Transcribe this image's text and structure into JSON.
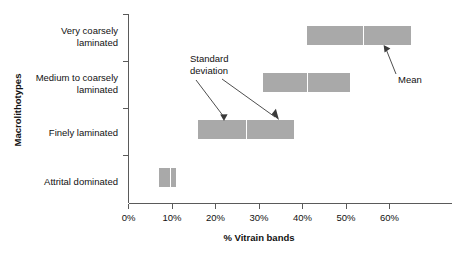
{
  "chart_data": {
    "type": "bar",
    "orientation": "horizontal",
    "title": "",
    "xlabel": "% Vitrain bands",
    "ylabel": "Macrolithotypes",
    "xlim": [
      0,
      67
    ],
    "ylim": [
      0,
      4
    ],
    "grid": false,
    "legend": null,
    "x_ticks": [
      {
        "value": 0,
        "label": "0%"
      },
      {
        "value": 10,
        "label": "10%"
      },
      {
        "value": 20,
        "label": "20%"
      },
      {
        "value": 30,
        "label": "30%"
      },
      {
        "value": 40,
        "label": "40%"
      },
      {
        "value": 50,
        "label": "50%"
      },
      {
        "value": 60,
        "label": "60%"
      }
    ],
    "categories": [
      "Very coarsely laminated",
      "Medium to coarsely laminated",
      "Finely laminated",
      "Attrital dominated"
    ],
    "category_labels_wrapped": [
      [
        "Very coarsely",
        "laminated"
      ],
      [
        "Medium to coarsely",
        "laminated"
      ],
      [
        "Finely laminated"
      ],
      [
        "Attrital dominated"
      ]
    ],
    "series_description": "Mean % vitrain bands with +/- one standard deviation range shown as a shaded bar; white vertical line marks the mean.",
    "bars": [
      {
        "category": "Very coarsely laminated",
        "low": 41,
        "high": 65,
        "mean": 54
      },
      {
        "category": "Medium to coarsely laminated",
        "low": 31,
        "high": 51,
        "mean": 41
      },
      {
        "category": "Finely laminated",
        "low": 16,
        "high": 38,
        "mean": 27
      },
      {
        "category": "Attrital dominated",
        "low": 7,
        "high": 11,
        "mean": 9.5
      }
    ],
    "annotations": [
      {
        "name": "standard-deviation",
        "lines": [
          "Standard",
          "deviation"
        ],
        "points_to": "Finely laminated bar edges"
      },
      {
        "name": "mean",
        "lines": [
          "Mean"
        ],
        "points_to": "Very coarsely laminated mean line"
      }
    ],
    "colors": {
      "bar_fill": "#a9a9a9",
      "mean_line": "#ffffff",
      "axis": "#5a5a5a",
      "text": "#111111",
      "background": "#ffffff"
    }
  }
}
